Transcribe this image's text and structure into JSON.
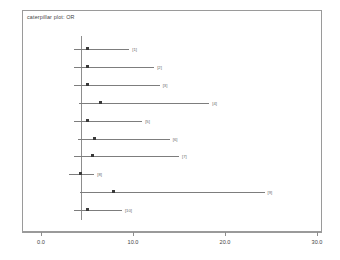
{
  "plot": {
    "title": "caterpillar plot: OR",
    "reference_line_value": 4.35
  },
  "axis": {
    "ticks": [
      "0.0",
      "10.0",
      "20.0",
      "30.0"
    ],
    "tick_values": [
      0,
      10,
      20,
      30
    ],
    "min": 0,
    "max": 32.6
  },
  "chart_data": {
    "type": "scatter",
    "title": "caterpillar plot: OR",
    "xlabel": "",
    "ylabel": "",
    "xlim": [
      0,
      32.6
    ],
    "grid": false,
    "legend": null,
    "reference_line": 4.35,
    "categories": [
      "[1]",
      "[2]",
      "[3]",
      "[4]",
      "[5]",
      "[6]",
      "[7]",
      "[8]",
      "[9]",
      "[10]"
    ],
    "points": [
      {
        "label": "[1]",
        "estimate": 5.0,
        "lower": 3.6,
        "upper": 9.6
      },
      {
        "label": "[2]",
        "estimate": 5.0,
        "lower": 3.6,
        "upper": 12.3
      },
      {
        "label": "[3]",
        "estimate": 5.0,
        "lower": 3.6,
        "upper": 12.9
      },
      {
        "label": "[4]",
        "estimate": 6.5,
        "lower": 4.1,
        "upper": 18.3
      },
      {
        "label": "[5]",
        "estimate": 5.0,
        "lower": 3.6,
        "upper": 11.0
      },
      {
        "label": "[6]",
        "estimate": 5.8,
        "lower": 4.0,
        "upper": 14.0
      },
      {
        "label": "[7]",
        "estimate": 5.6,
        "lower": 3.6,
        "upper": 15.0
      },
      {
        "label": "[8]",
        "estimate": 4.3,
        "lower": 3.0,
        "upper": 5.8
      },
      {
        "label": "[9]",
        "estimate": 7.9,
        "lower": 4.2,
        "upper": 24.3
      },
      {
        "label": "[10]",
        "estimate": 5.0,
        "lower": 3.6,
        "upper": 8.8
      }
    ]
  }
}
